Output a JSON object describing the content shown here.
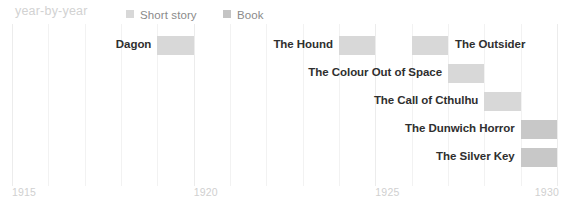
{
  "header": {
    "title": "year-by-year",
    "legend": [
      {
        "name": "short-story",
        "label": "Short story",
        "color": "#d8d8d8"
      },
      {
        "name": "book",
        "label": "Book",
        "color": "#c4c4c4"
      }
    ]
  },
  "axis": {
    "ticks": [
      "1915",
      "1920",
      "1925",
      "1930"
    ],
    "tick_values": [
      1915,
      1920,
      1925,
      1930
    ],
    "xlim": [
      1915,
      1930
    ],
    "gridline_years": [
      1915,
      1916,
      1917,
      1918,
      1919,
      1920,
      1921,
      1922,
      1923,
      1924,
      1925,
      1926,
      1927,
      1928,
      1929,
      1930
    ]
  },
  "chart_data": {
    "type": "bar",
    "orientation": "horizontal",
    "title": "year-by-year",
    "xlabel": "",
    "ylabel": "",
    "xlim": [
      1915,
      1930
    ],
    "grid": true,
    "legend_position": "top",
    "series": [
      {
        "name": "Short story",
        "color": "#d8d8d8"
      },
      {
        "name": "Book",
        "color": "#c4c4c4"
      }
    ],
    "categories": [
      "Dagon",
      "The Hound",
      "The Outsider",
      "The Colour Out of Space",
      "The Call of Cthulhu",
      "The Dunwich Horror",
      "The Silver Key"
    ],
    "bars": [
      {
        "label": "Dagon",
        "start": 1919,
        "end": 1920,
        "row": 0,
        "category": "Short story",
        "color": "#d8d8d8",
        "label_side": "left"
      },
      {
        "label": "The Hound",
        "start": 1924,
        "end": 1925,
        "row": 0,
        "category": "Short story",
        "color": "#d8d8d8",
        "label_side": "left"
      },
      {
        "label": "The Outsider",
        "start": 1926,
        "end": 1927,
        "row": 0,
        "category": "Short story",
        "color": "#d8d8d8",
        "label_side": "right"
      },
      {
        "label": "The Colour Out of Space",
        "start": 1927,
        "end": 1928,
        "row": 1,
        "category": "Short story",
        "color": "#d8d8d8",
        "label_side": "left"
      },
      {
        "label": "The Call of Cthulhu",
        "start": 1928,
        "end": 1929,
        "row": 2,
        "category": "Short story",
        "color": "#d8d8d8",
        "label_side": "left"
      },
      {
        "label": "The Dunwich Horror",
        "start": 1929,
        "end": 1930,
        "row": 3,
        "category": "Book",
        "color": "#c8c8c8",
        "label_side": "left"
      },
      {
        "label": "The Silver Key",
        "start": 1929,
        "end": 1930,
        "row": 4,
        "category": "Book",
        "color": "#c8c8c8",
        "label_side": "left"
      }
    ]
  }
}
